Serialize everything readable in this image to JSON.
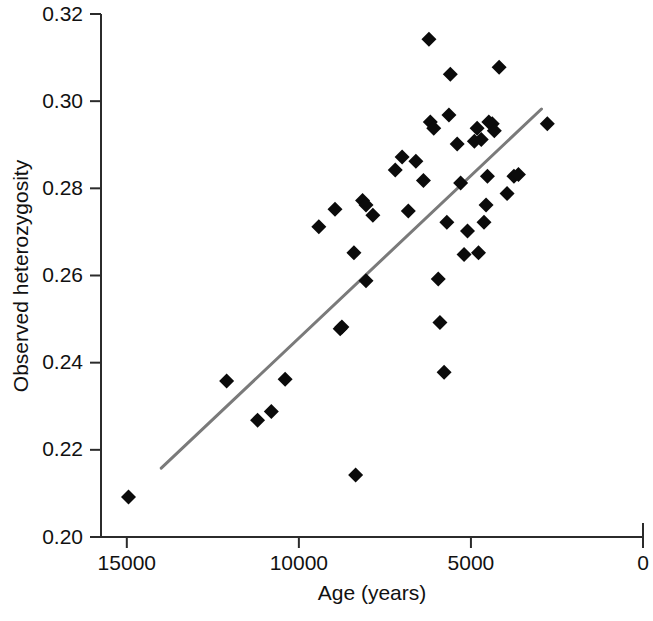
{
  "chart_data": {
    "type": "scatter",
    "title": "",
    "xlabel": "Age (years)",
    "ylabel": "Observed heterozygosity",
    "xlim": [
      15750,
      0
    ],
    "ylim": [
      0.2,
      0.32
    ],
    "x_reversed": true,
    "grid": false,
    "legend": null,
    "xticks": [
      15000,
      10000,
      5000,
      0
    ],
    "xticklabels": [
      "15000",
      "10000",
      "5000",
      "0"
    ],
    "yticks": [
      0.2,
      0.22,
      0.24,
      0.26,
      0.28,
      0.3,
      0.32
    ],
    "yticklabels": [
      "0.20",
      "0.22",
      "0.24",
      "0.26",
      "0.28",
      "0.30",
      "0.32"
    ],
    "marker": "diamond",
    "marker_color": "#0b0b0b",
    "points": [
      {
        "x": 14950,
        "y": 0.2092
      },
      {
        "x": 12100,
        "y": 0.2358
      },
      {
        "x": 11200,
        "y": 0.2268
      },
      {
        "x": 10800,
        "y": 0.2288
      },
      {
        "x": 10400,
        "y": 0.2362
      },
      {
        "x": 9420,
        "y": 0.2712
      },
      {
        "x": 8950,
        "y": 0.2752
      },
      {
        "x": 8800,
        "y": 0.2478
      },
      {
        "x": 8750,
        "y": 0.2482
      },
      {
        "x": 8400,
        "y": 0.2652
      },
      {
        "x": 8350,
        "y": 0.2142
      },
      {
        "x": 8150,
        "y": 0.2772
      },
      {
        "x": 8050,
        "y": 0.2762
      },
      {
        "x": 8050,
        "y": 0.2588
      },
      {
        "x": 7850,
        "y": 0.2738
      },
      {
        "x": 7200,
        "y": 0.2842
      },
      {
        "x": 7000,
        "y": 0.2872
      },
      {
        "x": 6820,
        "y": 0.2748
      },
      {
        "x": 6600,
        "y": 0.2862
      },
      {
        "x": 6380,
        "y": 0.2818
      },
      {
        "x": 6220,
        "y": 0.3142
      },
      {
        "x": 6180,
        "y": 0.2952
      },
      {
        "x": 6080,
        "y": 0.2938
      },
      {
        "x": 5950,
        "y": 0.2592
      },
      {
        "x": 5900,
        "y": 0.2492
      },
      {
        "x": 5780,
        "y": 0.2378
      },
      {
        "x": 5700,
        "y": 0.2722
      },
      {
        "x": 5640,
        "y": 0.2968
      },
      {
        "x": 5600,
        "y": 0.3062
      },
      {
        "x": 5400,
        "y": 0.2902
      },
      {
        "x": 5300,
        "y": 0.2812
      },
      {
        "x": 5200,
        "y": 0.2648
      },
      {
        "x": 5100,
        "y": 0.2702
      },
      {
        "x": 4900,
        "y": 0.2908
      },
      {
        "x": 4820,
        "y": 0.2938
      },
      {
        "x": 4780,
        "y": 0.2652
      },
      {
        "x": 4700,
        "y": 0.2912
      },
      {
        "x": 4620,
        "y": 0.2722
      },
      {
        "x": 4560,
        "y": 0.2762
      },
      {
        "x": 4520,
        "y": 0.2828
      },
      {
        "x": 4480,
        "y": 0.2952
      },
      {
        "x": 4380,
        "y": 0.2948
      },
      {
        "x": 4320,
        "y": 0.2932
      },
      {
        "x": 4180,
        "y": 0.3078
      },
      {
        "x": 3950,
        "y": 0.2788
      },
      {
        "x": 3750,
        "y": 0.2828
      },
      {
        "x": 3620,
        "y": 0.2832
      },
      {
        "x": 2780,
        "y": 0.2948
      }
    ],
    "fit_line": {
      "label": "regression line",
      "color": "#7a7a7a",
      "x_start": 14000,
      "y_start": 0.2158,
      "x_end": 2950,
      "y_end": 0.2982
    }
  }
}
